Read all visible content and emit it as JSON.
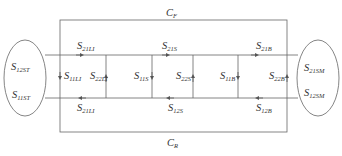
{
  "diagram": {
    "type": "signal-flow",
    "line_color": "#555555",
    "text_color": "#333333",
    "loops": {
      "forward": {
        "label": "C",
        "sub": "F"
      },
      "reverse": {
        "label": "C",
        "sub": "R"
      }
    },
    "left_ellipse": {
      "top": {
        "label": "S",
        "sub": "12ST"
      },
      "bottom": {
        "label": "S",
        "sub": "11ST"
      }
    },
    "right_ellipse": {
      "top": {
        "label": "S",
        "sub": "21SM"
      },
      "bottom": {
        "label": "S",
        "sub": "12SM"
      }
    },
    "top_row": [
      {
        "label": "S",
        "sub": "21LI"
      },
      {
        "label": "S",
        "sub": "21S"
      },
      {
        "label": "S",
        "sub": "21B"
      }
    ],
    "bottom_row": [
      {
        "label": "S",
        "sub": "21LI"
      },
      {
        "label": "S",
        "sub": "12S"
      },
      {
        "label": "S",
        "sub": "12B"
      }
    ],
    "verticals": [
      {
        "label": "S",
        "sub": "11LI"
      },
      {
        "label": "S",
        "sub": "22LI"
      },
      {
        "label": "S",
        "sub": "11S"
      },
      {
        "label": "S",
        "sub": "22S"
      },
      {
        "label": "S",
        "sub": "11B"
      },
      {
        "label": "S",
        "sub": "22B"
      }
    ]
  }
}
